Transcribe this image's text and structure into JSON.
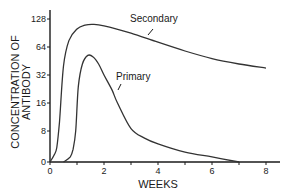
{
  "chart_data": {
    "type": "line",
    "title": "",
    "xlabel": "WEEKS",
    "ylabel_lines": [
      "CONCENTRATION OF",
      "ANTIBODY"
    ],
    "xlim": [
      0,
      8.5
    ],
    "x_ticks": [
      0,
      1,
      2,
      3,
      4,
      5,
      6,
      7,
      8
    ],
    "x_tick_labels": [
      "0",
      "",
      "2",
      "",
      "4",
      "",
      "6",
      "",
      "8"
    ],
    "y_scale": "log2 (with 0 baseline)",
    "y_ticks": [
      0,
      8,
      16,
      32,
      64,
      128
    ],
    "y_tick_labels": [
      "0",
      "8",
      "16",
      "32",
      "64",
      "128"
    ],
    "series": [
      {
        "name": "Secondary",
        "x": [
          0,
          0.15,
          0.25,
          0.35,
          0.5,
          0.7,
          1.0,
          1.3,
          1.6,
          2.0,
          3.0,
          4.0,
          5.0,
          6.0,
          7.0,
          8.0
        ],
        "y": [
          0,
          0.5,
          2,
          10,
          40,
          75,
          100,
          110,
          112,
          108,
          90,
          72,
          58,
          48,
          42,
          38
        ]
      },
      {
        "name": "Primary",
        "x": [
          0.5,
          0.75,
          0.85,
          0.95,
          1.05,
          1.2,
          1.4,
          1.6,
          1.8,
          2.0,
          2.3,
          2.5,
          3.0,
          3.5,
          4.0,
          5.0,
          6.0,
          7.0
        ],
        "y": [
          0,
          0.3,
          1.5,
          8,
          24,
          42,
          52,
          50,
          42,
          32,
          22,
          16,
          8.5,
          5,
          3,
          1,
          0.3,
          0
        ]
      }
    ],
    "annotations": [
      {
        "text": "Secondary",
        "points_to_series": "Secondary"
      },
      {
        "text": "Primary",
        "points_to_series": "Primary"
      }
    ],
    "grid": false,
    "legend": "none (inline annotations)"
  }
}
